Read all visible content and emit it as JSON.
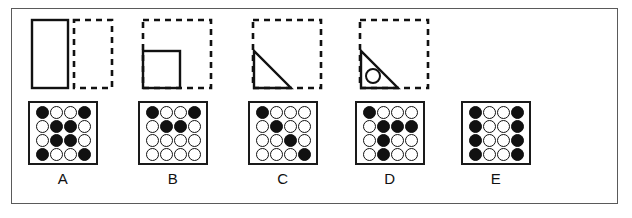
{
  "puzzle": {
    "type": "figure-analogy-matrix",
    "colors": {
      "ink": "#111111",
      "frame": "#5a5a5a",
      "background": "#ffffff"
    },
    "stimulus_panels": [
      {
        "id": "panel-1",
        "name": "tall-rectangle-panel",
        "solid_shape": "rectangle",
        "solid_position": "left",
        "dashed_shape": "square",
        "dashed_position": "right",
        "inner_mark": "none"
      },
      {
        "id": "panel-2",
        "name": "square-in-dashed-square-panel",
        "solid_shape": "square",
        "solid_position": "bottom-left",
        "dashed_shape": "square",
        "dashed_position": "enclosing",
        "inner_mark": "none"
      },
      {
        "id": "panel-3",
        "name": "triangle-in-dashed-square-panel",
        "solid_shape": "right-triangle",
        "solid_position": "bottom-left",
        "dashed_shape": "square",
        "dashed_position": "enclosing",
        "inner_mark": "none"
      },
      {
        "id": "panel-4",
        "name": "triangle-with-circle-panel",
        "solid_shape": "right-triangle",
        "solid_position": "bottom-left",
        "dashed_shape": "square",
        "dashed_position": "enclosing",
        "inner_mark": "circle"
      }
    ],
    "options": [
      {
        "label": "A",
        "name": "option-a",
        "rows": [
          [
            "filled",
            "open",
            "open",
            "filled"
          ],
          [
            "open",
            "filled",
            "filled",
            "open"
          ],
          [
            "open",
            "filled",
            "filled",
            "open"
          ],
          [
            "filled",
            "open",
            "open",
            "filled"
          ]
        ]
      },
      {
        "label": "B",
        "name": "option-b",
        "rows": [
          [
            "filled",
            "open",
            "open",
            "filled"
          ],
          [
            "open",
            "filled",
            "filled",
            "open"
          ],
          [
            "open",
            "open",
            "open",
            "open"
          ],
          [
            "open",
            "open",
            "open",
            "open"
          ]
        ]
      },
      {
        "label": "C",
        "name": "option-c",
        "rows": [
          [
            "filled",
            "open",
            "open",
            "open"
          ],
          [
            "open",
            "filled",
            "open",
            "open"
          ],
          [
            "open",
            "open",
            "filled",
            "open"
          ],
          [
            "open",
            "open",
            "open",
            "filled"
          ]
        ]
      },
      {
        "label": "D",
        "name": "option-d",
        "rows": [
          [
            "filled",
            "open",
            "open",
            "open"
          ],
          [
            "open",
            "filled",
            "filled",
            "filled"
          ],
          [
            "open",
            "filled",
            "open",
            "open"
          ],
          [
            "open",
            "filled",
            "open",
            "open"
          ]
        ]
      },
      {
        "label": "E",
        "name": "option-e",
        "rows": [
          [
            "filled",
            "open",
            "open",
            "filled"
          ],
          [
            "filled",
            "open",
            "open",
            "filled"
          ],
          [
            "filled",
            "open",
            "open",
            "filled"
          ],
          [
            "filled",
            "open",
            "open",
            "filled"
          ]
        ]
      }
    ]
  }
}
